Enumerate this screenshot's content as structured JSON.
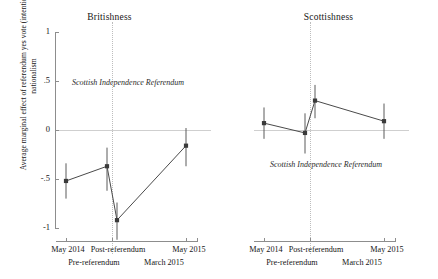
{
  "chart_data": {
    "type": "line",
    "title": "",
    "xlabel": "",
    "ylabel": "Average marginal effect of referendum yes vote (intention) on nationalism",
    "ylim": [
      -1,
      1
    ],
    "yticks": [
      1,
      0.5,
      0,
      -0.5,
      -1
    ],
    "ytick_labels": [
      "1",
      ".5",
      "0",
      "-.5",
      "-1"
    ],
    "grid": false,
    "legend": "none",
    "zero_reference_line": 0,
    "x": [
      1,
      2,
      3,
      4
    ],
    "categories": [
      "May 2014",
      "Pre-referendum",
      "Post-referendum",
      "March 2015"
    ],
    "xtick_labels_top": [
      "May 2014",
      "",
      "Post-referendum",
      "",
      "May 2015"
    ],
    "xtick_labels_row1": [
      "May 2014",
      "Post-referendum",
      "May 2015"
    ],
    "xtick_labels_row2": [
      "Pre-referendum",
      "March 2015"
    ],
    "panels": [
      {
        "name": "Britishness",
        "title": "Britishness",
        "annotation": "Scottish Independence Referendum",
        "annotation_y": 0.48,
        "referendum_line_x": 2.55,
        "values": [
          -0.52,
          -0.37,
          -0.92,
          -0.16
        ],
        "ci_low": [
          -0.7,
          -0.62,
          -1.12,
          -0.37
        ],
        "ci_high": [
          -0.34,
          -0.18,
          -0.74,
          0.02
        ]
      },
      {
        "name": "Scottishness",
        "title": "Scottishness",
        "annotation": "Scottish Independence Referendum",
        "annotation_y": -0.36,
        "referendum_line_x": 2.55,
        "values": [
          0.07,
          -0.03,
          0.3,
          0.09
        ],
        "ci_low": [
          -0.09,
          -0.24,
          0.12,
          -0.09
        ],
        "ci_high": [
          0.23,
          0.17,
          0.46,
          0.27
        ]
      }
    ]
  }
}
